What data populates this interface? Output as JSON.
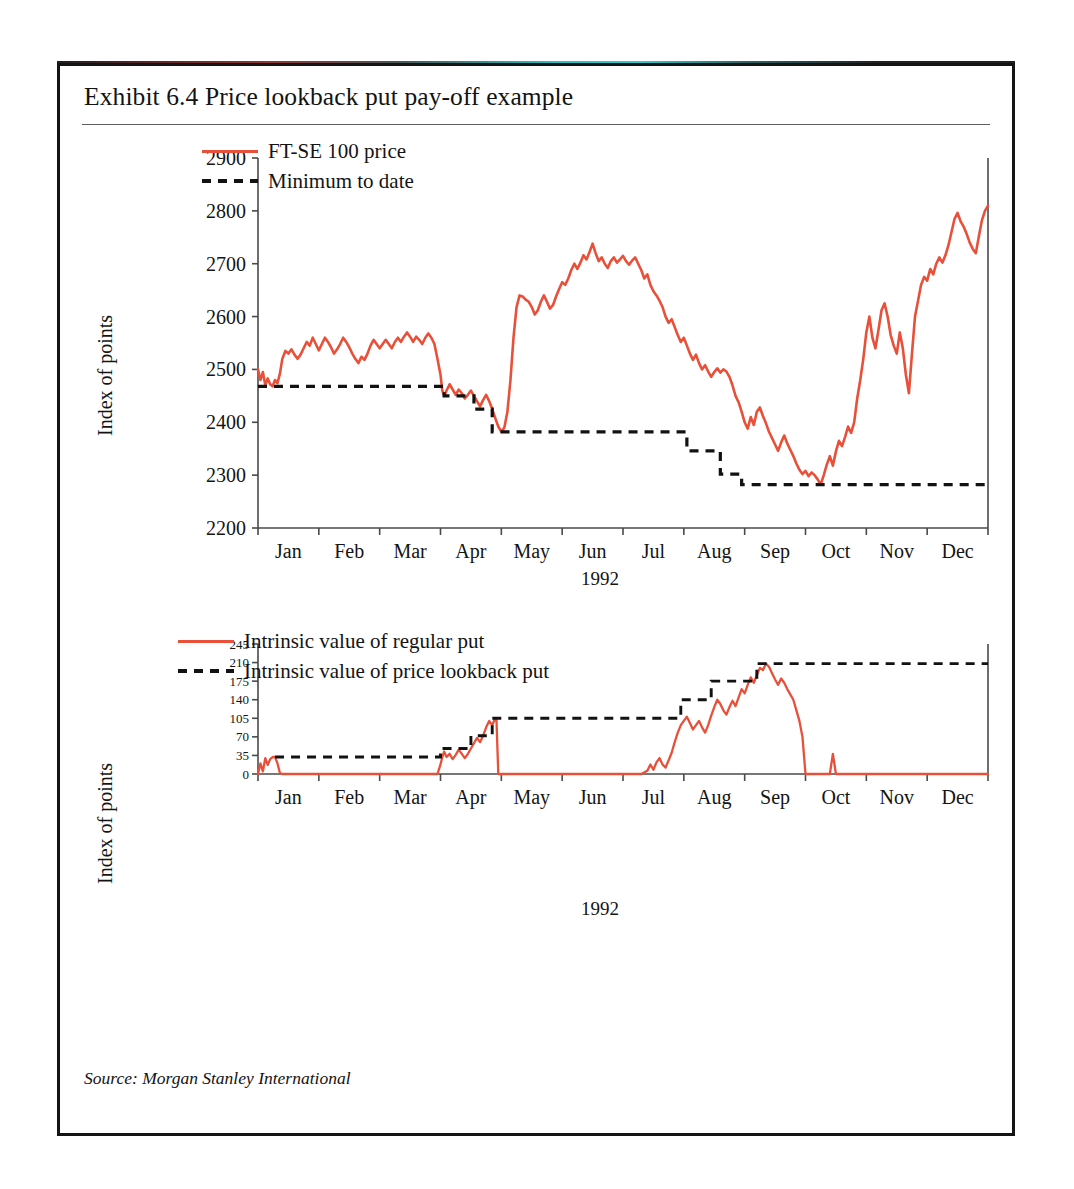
{
  "exhibit": {
    "title": "Exhibit 6.4  Price lookback put pay-off example",
    "source": "Source: Morgan Stanley International",
    "frame_color": "#141414",
    "series_color": "#e8503a",
    "reference_color": "#121212"
  },
  "chart_data": [
    {
      "id": "price-chart",
      "type": "line",
      "title": "",
      "xlabel": "1992",
      "ylabel": "Index of points",
      "ylim": [
        2200,
        2900
      ],
      "yticks": [
        2200,
        2300,
        2400,
        2500,
        2600,
        2700,
        2800,
        2900
      ],
      "ytick_labels": [
        "2200",
        "2300",
        "2400",
        "2500",
        "2600",
        "2700",
        "2800",
        "2900"
      ],
      "xlim": [
        0,
        12
      ],
      "xticks": [
        0,
        1,
        2,
        3,
        4,
        5,
        6,
        7,
        8,
        9,
        10,
        11,
        12
      ],
      "categories": [
        "Jan",
        "Feb",
        "Mar",
        "Apr",
        "May",
        "Jun",
        "Jul",
        "Aug",
        "Sep",
        "Oct",
        "Nov",
        "Dec"
      ],
      "grid": false,
      "legend_position": "top-left",
      "series": [
        {
          "name": "FT-SE 100 price",
          "style": "solid",
          "color": "#e8503a",
          "x": [
            0.0,
            0.04,
            0.08,
            0.12,
            0.16,
            0.2,
            0.24,
            0.28,
            0.32,
            0.36,
            0.4,
            0.45,
            0.5,
            0.55,
            0.6,
            0.65,
            0.7,
            0.75,
            0.8,
            0.85,
            0.9,
            0.95,
            1.0,
            1.05,
            1.1,
            1.15,
            1.2,
            1.25,
            1.3,
            1.35,
            1.4,
            1.45,
            1.5,
            1.55,
            1.6,
            1.65,
            1.7,
            1.75,
            1.8,
            1.85,
            1.9,
            1.95,
            2.0,
            2.05,
            2.1,
            2.15,
            2.2,
            2.25,
            2.3,
            2.35,
            2.4,
            2.45,
            2.5,
            2.55,
            2.6,
            2.65,
            2.7,
            2.75,
            2.8,
            2.85,
            2.9,
            2.95,
            3.0,
            3.03,
            3.06,
            3.1,
            3.15,
            3.2,
            3.25,
            3.3,
            3.35,
            3.4,
            3.45,
            3.5,
            3.55,
            3.6,
            3.65,
            3.7,
            3.75,
            3.8,
            3.85,
            3.9,
            3.95,
            4.0,
            4.05,
            4.1,
            4.15,
            4.2,
            4.25,
            4.3,
            4.35,
            4.4,
            4.45,
            4.5,
            4.55,
            4.6,
            4.65,
            4.7,
            4.75,
            4.8,
            4.85,
            4.9,
            4.95,
            5.0,
            5.05,
            5.1,
            5.15,
            5.2,
            5.25,
            5.3,
            5.35,
            5.4,
            5.45,
            5.5,
            5.55,
            5.6,
            5.65,
            5.7,
            5.75,
            5.8,
            5.85,
            5.9,
            5.95,
            6.0,
            6.05,
            6.1,
            6.15,
            6.2,
            6.25,
            6.3,
            6.35,
            6.4,
            6.45,
            6.5,
            6.55,
            6.6,
            6.65,
            6.7,
            6.75,
            6.8,
            6.85,
            6.9,
            6.95,
            7.0,
            7.05,
            7.1,
            7.15,
            7.2,
            7.25,
            7.3,
            7.35,
            7.4,
            7.45,
            7.5,
            7.55,
            7.6,
            7.65,
            7.7,
            7.75,
            7.8,
            7.85,
            7.9,
            7.95,
            8.0,
            8.05,
            8.1,
            8.15,
            8.2,
            8.25,
            8.3,
            8.35,
            8.4,
            8.45,
            8.5,
            8.55,
            8.6,
            8.65,
            8.7,
            8.75,
            8.8,
            8.85,
            8.9,
            8.95,
            9.0,
            9.05,
            9.1,
            9.15,
            9.2,
            9.25,
            9.3,
            9.35,
            9.4,
            9.45,
            9.5,
            9.55,
            9.6,
            9.65,
            9.7,
            9.75,
            9.8,
            9.85,
            9.9,
            9.95,
            10.0,
            10.05,
            10.1,
            10.15,
            10.2,
            10.25,
            10.3,
            10.35,
            10.4,
            10.45,
            10.5,
            10.55,
            10.6,
            10.65,
            10.7,
            10.75,
            10.8,
            10.85,
            10.9,
            10.95,
            11.0,
            11.05,
            11.1,
            11.15,
            11.2,
            11.25,
            11.3,
            11.35,
            11.4,
            11.45,
            11.5,
            11.55,
            11.6,
            11.65,
            11.7,
            11.75,
            11.8,
            11.85,
            11.9,
            11.95,
            12.0
          ],
          "y": [
            2500,
            2480,
            2495,
            2470,
            2483,
            2472,
            2468,
            2480,
            2474,
            2492,
            2520,
            2535,
            2530,
            2538,
            2528,
            2520,
            2528,
            2540,
            2552,
            2545,
            2560,
            2548,
            2536,
            2548,
            2560,
            2552,
            2542,
            2530,
            2538,
            2548,
            2560,
            2552,
            2542,
            2530,
            2520,
            2512,
            2524,
            2518,
            2530,
            2545,
            2556,
            2548,
            2540,
            2548,
            2556,
            2548,
            2540,
            2552,
            2560,
            2552,
            2562,
            2570,
            2562,
            2552,
            2562,
            2556,
            2548,
            2560,
            2568,
            2560,
            2548,
            2520,
            2490,
            2460,
            2450,
            2460,
            2472,
            2462,
            2452,
            2462,
            2455,
            2445,
            2452,
            2460,
            2450,
            2440,
            2430,
            2442,
            2452,
            2440,
            2425,
            2408,
            2392,
            2382,
            2390,
            2420,
            2480,
            2560,
            2618,
            2640,
            2638,
            2632,
            2628,
            2618,
            2604,
            2612,
            2628,
            2640,
            2628,
            2615,
            2622,
            2638,
            2652,
            2665,
            2660,
            2672,
            2688,
            2700,
            2690,
            2702,
            2716,
            2708,
            2722,
            2738,
            2720,
            2705,
            2712,
            2700,
            2692,
            2705,
            2712,
            2702,
            2708,
            2715,
            2705,
            2698,
            2706,
            2712,
            2700,
            2688,
            2672,
            2680,
            2660,
            2648,
            2640,
            2630,
            2618,
            2600,
            2588,
            2595,
            2580,
            2565,
            2552,
            2560,
            2545,
            2530,
            2518,
            2528,
            2512,
            2500,
            2508,
            2496,
            2486,
            2495,
            2502,
            2494,
            2500,
            2496,
            2486,
            2470,
            2450,
            2438,
            2420,
            2400,
            2388,
            2410,
            2395,
            2420,
            2428,
            2412,
            2398,
            2382,
            2370,
            2358,
            2346,
            2362,
            2375,
            2360,
            2348,
            2336,
            2322,
            2310,
            2302,
            2308,
            2298,
            2305,
            2300,
            2292,
            2282,
            2300,
            2320,
            2336,
            2318,
            2345,
            2365,
            2355,
            2372,
            2392,
            2380,
            2400,
            2445,
            2480,
            2520,
            2570,
            2600,
            2560,
            2540,
            2575,
            2612,
            2625,
            2600,
            2565,
            2545,
            2530,
            2570,
            2540,
            2490,
            2455,
            2530,
            2600,
            2630,
            2660,
            2675,
            2668,
            2690,
            2680,
            2700,
            2712,
            2702,
            2716,
            2735,
            2760,
            2785,
            2796,
            2780,
            2770,
            2756,
            2740,
            2728,
            2720,
            2752,
            2782,
            2800,
            2810,
            2826,
            2840,
            2836,
            2848,
            2858,
            2852,
            2866,
            2862
          ],
          "comment": "FT-SE 100 index level through 1992"
        },
        {
          "name": "Minimum to date",
          "style": "dashed",
          "color": "#121212",
          "step_points": [
            {
              "x_start": 0.0,
              "x_end": 0.28,
              "y": 2468
            },
            {
              "x_start": 0.28,
              "x_end": 3.06,
              "y": 2468
            },
            {
              "x_start": 3.06,
              "x_end": 3.55,
              "y": 2450
            },
            {
              "x_start": 3.55,
              "x_end": 3.85,
              "y": 2425
            },
            {
              "x_start": 3.85,
              "x_end": 7.05,
              "y": 2382
            },
            {
              "x_start": 7.05,
              "x_end": 7.6,
              "y": 2346
            },
            {
              "x_start": 7.6,
              "x_end": 7.95,
              "y": 2302
            },
            {
              "x_start": 7.95,
              "x_end": 12.0,
              "y": 2282
            }
          ],
          "comment": "running minimum of the FT-SE 100 price"
        }
      ]
    },
    {
      "id": "payoff-chart",
      "type": "line",
      "title": "",
      "xlabel": "1992",
      "ylabel": "Index of points",
      "ylim": [
        0,
        245
      ],
      "yticks": [
        0,
        35,
        70,
        105,
        140,
        175,
        210,
        245
      ],
      "ytick_labels": [
        "0",
        "35",
        "70",
        "105",
        "140",
        "175",
        "210",
        "245"
      ],
      "xlim": [
        0,
        12
      ],
      "xticks": [
        0,
        1,
        2,
        3,
        4,
        5,
        6,
        7,
        8,
        9,
        10,
        11,
        12
      ],
      "categories": [
        "Jan",
        "Feb",
        "Mar",
        "Apr",
        "May",
        "Jun",
        "Jul",
        "Aug",
        "Sep",
        "Oct",
        "Nov",
        "Dec"
      ],
      "grid": false,
      "legend_position": "top-left",
      "series": [
        {
          "name": "Intrinsic value of regular put",
          "style": "solid",
          "color": "#e8503a",
          "x": [
            0.0,
            0.04,
            0.08,
            0.12,
            0.16,
            0.2,
            0.24,
            0.28,
            0.32,
            0.36,
            0.4,
            0.45,
            0.5,
            0.6,
            0.8,
            1.0,
            1.5,
            2.0,
            2.5,
            2.8,
            2.9,
            2.95,
            3.0,
            3.03,
            3.06,
            3.1,
            3.15,
            3.2,
            3.25,
            3.3,
            3.35,
            3.4,
            3.45,
            3.5,
            3.55,
            3.6,
            3.65,
            3.7,
            3.75,
            3.8,
            3.85,
            3.9,
            3.92,
            3.95,
            4.0,
            4.5,
            5.0,
            5.5,
            6.0,
            6.3,
            6.4,
            6.45,
            6.5,
            6.55,
            6.6,
            6.65,
            6.7,
            6.75,
            6.8,
            6.85,
            6.9,
            6.95,
            7.0,
            7.05,
            7.1,
            7.15,
            7.2,
            7.25,
            7.3,
            7.35,
            7.4,
            7.45,
            7.5,
            7.55,
            7.6,
            7.65,
            7.7,
            7.75,
            7.8,
            7.85,
            7.9,
            7.95,
            8.0,
            8.05,
            8.1,
            8.15,
            8.2,
            8.25,
            8.3,
            8.35,
            8.4,
            8.45,
            8.5,
            8.55,
            8.6,
            8.65,
            8.7,
            8.75,
            8.8,
            8.85,
            8.9,
            8.95,
            9.0,
            9.3,
            9.4,
            9.45,
            9.5,
            9.55,
            9.6,
            10.0,
            10.5,
            11.0,
            11.5,
            12.0
          ],
          "y": [
            0,
            20,
            5,
            30,
            17,
            28,
            32,
            32,
            20,
            2,
            0,
            0,
            0,
            0,
            0,
            0,
            0,
            0,
            0,
            0,
            0,
            0,
            18,
            32,
            42,
            32,
            38,
            28,
            36,
            46,
            38,
            30,
            38,
            48,
            58,
            68,
            60,
            72,
            88,
            100,
            92,
            105,
            102,
            0,
            0,
            0,
            0,
            0,
            0,
            0,
            6,
            18,
            8,
            22,
            30,
            18,
            12,
            26,
            40,
            60,
            78,
            92,
            100,
            108,
            96,
            84,
            92,
            100,
            88,
            78,
            92,
            110,
            126,
            140,
            132,
            120,
            112,
            126,
            138,
            128,
            144,
            160,
            152,
            168,
            182,
            172,
            186,
            200,
            196,
            208,
            202,
            190,
            178,
            168,
            180,
            172,
            160,
            150,
            140,
            120,
            100,
            70,
            0,
            0,
            0,
            38,
            0,
            0,
            0,
            0,
            0,
            0,
            0,
            0
          ],
          "comment": "intrinsic value of a regular put struck at the start level"
        },
        {
          "name": "Intrinsic value of price lookback put",
          "style": "dashed",
          "color": "#121212",
          "step_points": [
            {
              "x_start": 0.28,
              "x_end": 3.0,
              "y": 32
            },
            {
              "x_start": 3.0,
              "x_end": 3.5,
              "y": 48
            },
            {
              "x_start": 3.5,
              "x_end": 3.85,
              "y": 72
            },
            {
              "x_start": 3.85,
              "x_end": 6.95,
              "y": 105
            },
            {
              "x_start": 6.95,
              "x_end": 7.45,
              "y": 140
            },
            {
              "x_start": 7.45,
              "x_end": 8.2,
              "y": 175
            },
            {
              "x_start": 8.2,
              "x_end": 12.0,
              "y": 208
            }
          ],
          "comment": "running maximum pay-off of the price lookback put"
        }
      ]
    }
  ]
}
